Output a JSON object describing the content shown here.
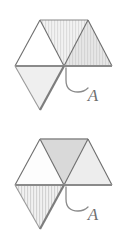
{
  "canvas": {
    "width": 126,
    "height": 238,
    "background": "#ffffff"
  },
  "style": {
    "edge_color": "#6e6e6e",
    "edge_color_dark": "#7a7a7a",
    "edge_width_thin": 1.1,
    "edge_width_thick": 2.2,
    "leader_color": "#8a8a8a",
    "leader_width": 1.3,
    "label_color": "#6f6f6f",
    "fill_white": "#ffffff",
    "fill_light": "#f0f0f0",
    "fill_medium": "#e2e2e2",
    "fill_dark": "#cfcfcf",
    "hatch_line_color": "#d2d2d2"
  },
  "geometry": {
    "note": "half-hexagon of three upward triangles on a common baseline, plus one downward triangle hanging below the left-middle span",
    "hex_left_x": 15,
    "hex_right_x": 112,
    "baseline_y": 66,
    "apex_y": 20,
    "bottom_vertex_y": 110,
    "center_x": 64,
    "triangle_half_width": 24
  },
  "figures": [
    {
      "id": "figure-top",
      "name": "top-figure",
      "top_triangles": [
        {
          "name": "top-left-triangle",
          "fill": "white",
          "hatched": false
        },
        {
          "name": "top-middle-triangle",
          "fill": "light",
          "hatched": true
        },
        {
          "name": "top-right-triangle",
          "fill": "medium",
          "hatched": true
        }
      ],
      "down_triangle": {
        "name": "lower-triangle",
        "fill": "light",
        "hatched": false
      },
      "label": {
        "text": "A",
        "name": "label-a",
        "x": 93,
        "y": 101
      },
      "leader": {
        "name": "leader-curve",
        "path": "M 66 68 L 66 80 Q 66 92 78 92 Q 84 92 88 88"
      }
    },
    {
      "id": "figure-bottom",
      "name": "bottom-figure",
      "top_triangles": [
        {
          "name": "top-left-triangle",
          "fill": "white",
          "hatched": false
        },
        {
          "name": "top-middle-triangle",
          "fill": "dark",
          "hatched": false
        },
        {
          "name": "top-right-triangle",
          "fill": "light",
          "hatched": false
        }
      ],
      "down_triangle": {
        "name": "lower-triangle",
        "fill": "light",
        "hatched": true
      },
      "label": {
        "text": "A",
        "name": "label-a",
        "x": 93,
        "y": 101
      },
      "leader": {
        "name": "leader-curve",
        "path": "M 66 68 L 66 80 Q 66 92 78 92 Q 84 92 88 88"
      }
    }
  ]
}
